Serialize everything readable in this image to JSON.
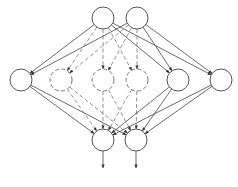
{
  "diagram": {
    "type": "neural-network-dropout",
    "colors": {
      "background": "#ffffff",
      "solid_stroke": "#444444",
      "dashed_stroke": "#777777"
    },
    "node_radius": 11,
    "layers": [
      {
        "name": "input",
        "nodes": [
          {
            "id": "i1",
            "x": 103,
            "y": 18,
            "style": "solid"
          },
          {
            "id": "i2",
            "x": 137,
            "y": 18,
            "style": "solid"
          }
        ]
      },
      {
        "name": "hidden",
        "nodes": [
          {
            "id": "h1",
            "x": 21,
            "y": 80,
            "style": "solid"
          },
          {
            "id": "h2",
            "x": 61,
            "y": 80,
            "style": "dashed"
          },
          {
            "id": "h3",
            "x": 103,
            "y": 80,
            "style": "dashed"
          },
          {
            "id": "h4",
            "x": 137,
            "y": 80,
            "style": "dashed"
          },
          {
            "id": "h5",
            "x": 178,
            "y": 80,
            "style": "solid"
          },
          {
            "id": "h6",
            "x": 221,
            "y": 80,
            "style": "solid"
          }
        ]
      },
      {
        "name": "output",
        "nodes": [
          {
            "id": "o1",
            "x": 103,
            "y": 140,
            "style": "solid"
          },
          {
            "id": "o2",
            "x": 136,
            "y": 140,
            "style": "solid"
          }
        ]
      }
    ],
    "output_arrows": [
      {
        "from": "o1",
        "x": 103,
        "y_end": 168
      },
      {
        "from": "o2",
        "x": 136,
        "y_end": 168
      }
    ]
  }
}
